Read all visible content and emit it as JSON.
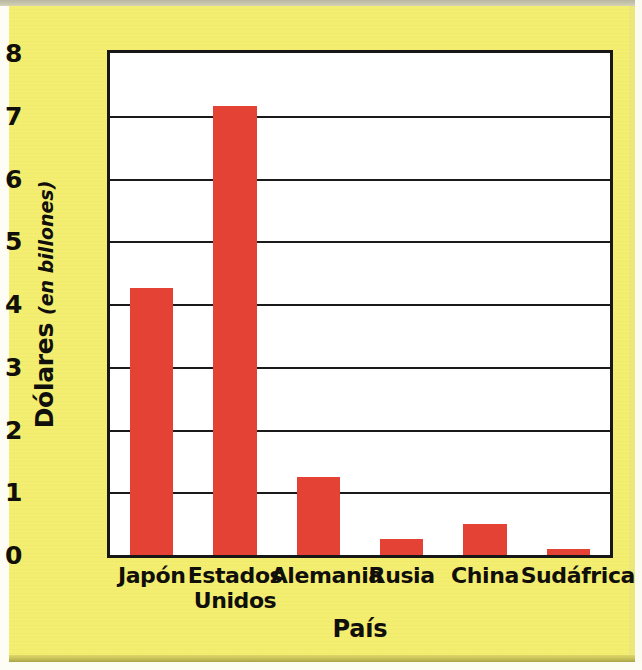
{
  "chart_data": {
    "type": "bar",
    "title": "",
    "xlabel": "País",
    "ylabel_main": "Dólares",
    "ylabel_sub": "(en billones)",
    "categories": [
      "Japón",
      "Estados Unidos",
      "Alemania",
      "Rusia",
      "China",
      "Sudáfrica"
    ],
    "category_lines": [
      [
        "Japón"
      ],
      [
        "Estados",
        "Unidos"
      ],
      [
        "Alemania"
      ],
      [
        "Rusia"
      ],
      [
        "China"
      ],
      [
        "Sudáfrica"
      ]
    ],
    "values": [
      4.25,
      7.15,
      1.25,
      0.25,
      0.5,
      0.1
    ],
    "ylim": [
      0,
      8
    ],
    "yticks": [
      0,
      1,
      2,
      3,
      4,
      5,
      6,
      7,
      8
    ],
    "ytick_labels": [
      "0",
      "1",
      "2",
      "3",
      "4",
      "5",
      "6",
      "7",
      "8"
    ],
    "grid": true,
    "legend": "none",
    "bar_color": "#e34234",
    "axis_color": "#171717",
    "plot_background": "#ffffff",
    "page_background": "#f4ee6e"
  }
}
